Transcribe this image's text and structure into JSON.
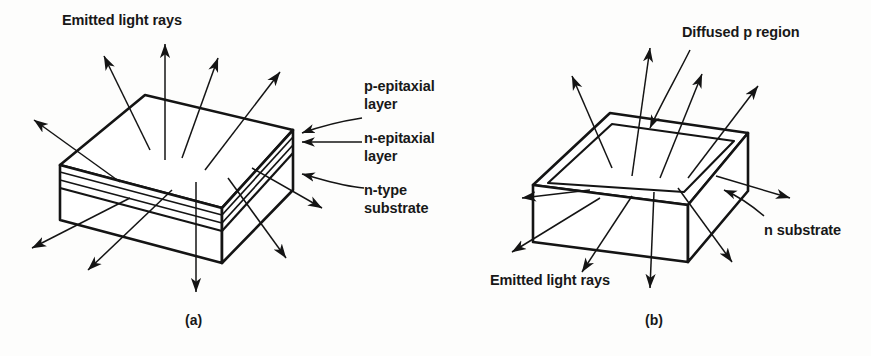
{
  "figure": {
    "kind": "technical-line-diagram",
    "background_color": "#fdfdfc",
    "line_color": "#141414",
    "text_color": "#181818"
  },
  "panel_a": {
    "caption": "(a)",
    "labels": {
      "emitted_rays": "Emitted light rays",
      "p_epitaxial": "p-epitaxial\nlayer",
      "p_epitaxial_line1": "p-epitaxial",
      "p_epitaxial_line2": "layer",
      "n_epitaxial_line1": "n-epitaxial",
      "n_epitaxial_line2": "layer",
      "n_type_substrate_line1": "n-type",
      "n_type_substrate_line2": "substrate"
    }
  },
  "panel_b": {
    "caption": "(b)",
    "labels": {
      "diffused_p_region": "Diffused p region",
      "n_substrate": "n substrate",
      "emitted_rays": "Emitted light rays"
    }
  },
  "geometry": {
    "panel_a_block": {
      "top_face": "60,165 145,95 293,130 222,208",
      "slab_thickness_px": 60,
      "epi_line_count": 3
    },
    "panel_b_block": {
      "top_face": "533,185 610,113 748,133 688,205",
      "inner_region_inset_px": 14,
      "slab_thickness_px": 58
    }
  }
}
